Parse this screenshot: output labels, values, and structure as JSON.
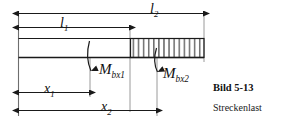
{
  "figure": {
    "caption_title": "Bild 5-13",
    "caption_subtitle": "Streckenlast",
    "dimensions": [
      {
        "id": "l2",
        "base": "l",
        "subscript": "2",
        "text": "l2"
      },
      {
        "id": "l1",
        "base": "l",
        "subscript": "1",
        "text": "l1"
      },
      {
        "id": "x1",
        "base": "x",
        "subscript": "1",
        "text": "x1"
      },
      {
        "id": "x2",
        "base": "x",
        "subscript": "2",
        "text": "x2"
      }
    ],
    "moments": [
      {
        "id": "Mbx1",
        "base": "M",
        "subscript": "bx1",
        "text": "Mbx1"
      },
      {
        "id": "Mbx2",
        "base": "M",
        "subscript": "bx2",
        "text": "Mbx2"
      }
    ],
    "colors": {
      "line": "#1a1a1a",
      "hatch": "#333333",
      "thin_rule": "#888888",
      "background": "#ffffff",
      "text": "#101010"
    }
  },
  "labels": {
    "l2_base": "l",
    "l2_sub": "2",
    "l1_base": "l",
    "l1_sub": "1",
    "x1_base": "x",
    "x1_sub": "1",
    "x2_base": "x",
    "x2_sub": "2",
    "m1_base": "M",
    "m1_sub": "bx1",
    "m2_base": "M",
    "m2_sub": "bx2"
  }
}
